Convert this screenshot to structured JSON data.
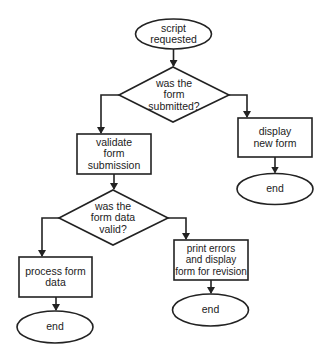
{
  "diagram": {
    "type": "flowchart",
    "colors": {
      "stroke": "#222222",
      "fill": "#ffffff",
      "text": "#222222"
    },
    "nodes": [
      {
        "id": "start",
        "shape": "ellipse",
        "lines": [
          "script",
          "requested"
        ]
      },
      {
        "id": "q_submitted",
        "shape": "diamond",
        "lines": [
          "was the",
          "form",
          "submitted?"
        ]
      },
      {
        "id": "validate",
        "shape": "rect",
        "lines": [
          "validate",
          "form",
          "submission"
        ]
      },
      {
        "id": "display_new",
        "shape": "rect",
        "lines": [
          "display",
          "new form"
        ]
      },
      {
        "id": "end_right",
        "shape": "ellipse",
        "lines": [
          "end"
        ]
      },
      {
        "id": "q_valid",
        "shape": "diamond",
        "lines": [
          "was the",
          "form data",
          "valid?"
        ]
      },
      {
        "id": "process",
        "shape": "rect",
        "lines": [
          "process form",
          "data"
        ]
      },
      {
        "id": "print_errors",
        "shape": "rect",
        "lines": [
          "print errors",
          "and display",
          "form for revision"
        ]
      },
      {
        "id": "end_left",
        "shape": "ellipse",
        "lines": [
          "end"
        ]
      },
      {
        "id": "end_mid",
        "shape": "ellipse",
        "lines": [
          "end"
        ]
      }
    ],
    "edges": [
      {
        "from": "start",
        "to": "q_submitted"
      },
      {
        "from": "q_submitted",
        "to": "validate",
        "side": "left"
      },
      {
        "from": "q_submitted",
        "to": "display_new",
        "side": "right"
      },
      {
        "from": "display_new",
        "to": "end_right"
      },
      {
        "from": "validate",
        "to": "q_valid"
      },
      {
        "from": "q_valid",
        "to": "process",
        "side": "left"
      },
      {
        "from": "q_valid",
        "to": "print_errors",
        "side": "right"
      },
      {
        "from": "process",
        "to": "end_left"
      },
      {
        "from": "print_errors",
        "to": "end_mid"
      }
    ]
  }
}
